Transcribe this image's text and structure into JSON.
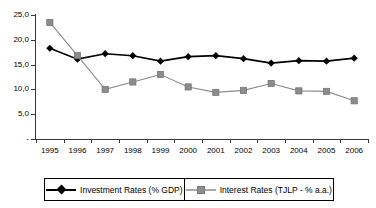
{
  "chart_data": {
    "type": "line",
    "title": "",
    "xlabel": "",
    "ylabel": "",
    "ylim": [
      0,
      25
    ],
    "yticks": [
      0,
      5,
      10,
      15,
      20,
      25
    ],
    "ytick_labels": [
      "-",
      "5,0",
      "10,0",
      "15,0",
      "20,0",
      "25,0"
    ],
    "grid": false,
    "legend_position": "bottom",
    "categories": [
      "1995",
      "1996",
      "1997",
      "1998",
      "1999",
      "2000",
      "2001",
      "2002",
      "2003",
      "2004",
      "2005",
      "2006"
    ],
    "series": [
      {
        "name": "Investment Rates (% GDP)",
        "marker": "diamond",
        "color": "#000000",
        "values": [
          18.3,
          16.1,
          17.2,
          16.8,
          15.7,
          16.6,
          16.8,
          16.2,
          15.3,
          15.8,
          15.7,
          16.3
        ]
      },
      {
        "name": "Interest Rates (TJLP - % a.a.)",
        "marker": "square",
        "color": "#8c8c8c",
        "values": [
          23.5,
          16.8,
          10.0,
          11.5,
          13.0,
          10.5,
          9.4,
          9.8,
          11.2,
          9.7,
          9.6,
          7.7
        ]
      }
    ]
  },
  "legend": {
    "entries": [
      {
        "label": "Investment Rates (% GDP)"
      },
      {
        "label": "Interest Rates (TJLP - % a.a.)"
      }
    ]
  },
  "colors": {
    "investment": "#000000",
    "interest": "#8c8c8c",
    "axis": "#3a3a3a",
    "background": "#ffffff"
  }
}
